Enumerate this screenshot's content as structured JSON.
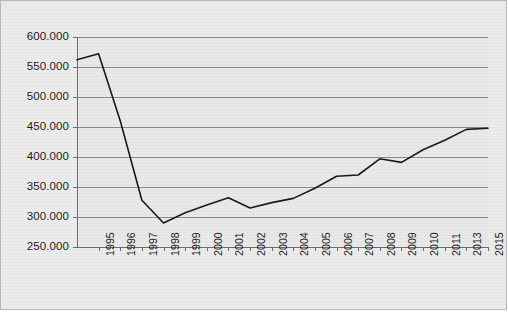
{
  "chart_data": {
    "type": "line",
    "title": "",
    "subtitle": "",
    "xlabel": "",
    "ylabel": "",
    "grid": "horizontal",
    "legend": "none",
    "ylim": [
      250000,
      600000
    ],
    "ytick_step": 50000,
    "ytick_labels": [
      "600.000",
      "550.000",
      "500.000",
      "450.000",
      "400.000",
      "350.000",
      "300.000",
      "250.000"
    ],
    "ytick_values": [
      600000,
      550000,
      500000,
      450000,
      400000,
      350000,
      300000,
      250000
    ],
    "xtick_labels": [
      "1995",
      "1996",
      "1997",
      "1998",
      "1999",
      "2000",
      "2001",
      "2002",
      "2003",
      "2004",
      "2005",
      "2006",
      "2007",
      "2008",
      "2009",
      "2010",
      "2011",
      "2013",
      "2015"
    ],
    "categories": [
      "1995",
      "1996",
      "1997",
      "1998",
      "1999",
      "2000",
      "2001",
      "2002",
      "2003",
      "2004",
      "2005",
      "2006",
      "2007",
      "2008",
      "2009",
      "2010",
      "2011",
      "2013",
      "2015"
    ],
    "values": [
      572000,
      460000,
      328000,
      290000,
      307000,
      320000,
      332000,
      315000,
      324000,
      331000,
      348000,
      368000,
      370000,
      397000,
      391000,
      412000,
      428000,
      446000,
      448000
    ],
    "start_point": {
      "label": "",
      "value": 562000
    },
    "annotations": [],
    "line_color": "#1a1a1a",
    "plot_background": "#e9e9e9",
    "gridline_color": "#8c8c8c"
  },
  "colors": {
    "line": "#1a1a1a",
    "grid": "#8c8c8c",
    "axis": "#6e6e6e",
    "plot_bg": "#e9e9e9",
    "frame": "#b9b9b9",
    "text": "#1c1c1c"
  }
}
